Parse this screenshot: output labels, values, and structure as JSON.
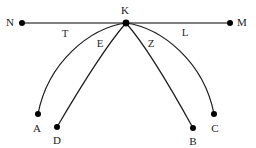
{
  "figure": {
    "background_color": "#ffffff",
    "line_color_baseline": "#808080",
    "line_color_curve": "#1a1a1a",
    "point_color": "#000000"
  },
  "points": [
    {
      "id": "N",
      "label": "N",
      "cx": 22,
      "cy": 23,
      "label_x": 10,
      "label_y": 22
    },
    {
      "id": "K",
      "label": "K",
      "cx": 126,
      "cy": 23,
      "label_x": 125,
      "label_y": 10
    },
    {
      "id": "M",
      "label": "M",
      "cx": 230,
      "cy": 23,
      "label_x": 242,
      "label_y": 22
    },
    {
      "id": "A",
      "label": "A",
      "cx": 38,
      "cy": 114,
      "label_x": 37,
      "label_y": 128
    },
    {
      "id": "D",
      "label": "D",
      "cx": 57,
      "cy": 127,
      "label_x": 57,
      "label_y": 140
    },
    {
      "id": "B",
      "label": "B",
      "cx": 193,
      "cy": 128,
      "label_x": 193,
      "label_y": 141
    },
    {
      "id": "C",
      "label": "C",
      "cx": 214,
      "cy": 114,
      "label_x": 215,
      "label_y": 128
    }
  ],
  "segment_labels": [
    {
      "id": "T",
      "label": "T",
      "x": 65,
      "y": 33
    },
    {
      "id": "E",
      "label": "E",
      "x": 100,
      "y": 43
    },
    {
      "id": "Z",
      "label": "Z",
      "x": 151,
      "y": 43
    },
    {
      "id": "L",
      "label": "L",
      "x": 185,
      "y": 32
    }
  ],
  "edges": [
    {
      "id": "NM",
      "kind": "straight",
      "from": "N",
      "to": "M",
      "path": "M 22 23 L 230 23",
      "color": "#808080",
      "width": 2
    },
    {
      "id": "KA",
      "kind": "arc",
      "from": "K",
      "to": "A",
      "path": "M 126 23 C 90 28 48 62 38 114",
      "color": "#1a1a1a",
      "width": 1.2
    },
    {
      "id": "KD",
      "kind": "chord",
      "from": "K",
      "to": "D",
      "path": "M 126 23 C 104 48 74 98 57 127",
      "color": "#1a1a1a",
      "width": 1.2
    },
    {
      "id": "KB",
      "kind": "chord",
      "from": "K",
      "to": "B",
      "path": "M 126 23 C 148 48 177 99 193 128",
      "color": "#1a1a1a",
      "width": 1.2
    },
    {
      "id": "KC",
      "kind": "arc",
      "from": "K",
      "to": "C",
      "path": "M 126 23 C 162 28 204 62 214 114",
      "color": "#1a1a1a",
      "width": 1.2
    }
  ],
  "point_radius": 3
}
